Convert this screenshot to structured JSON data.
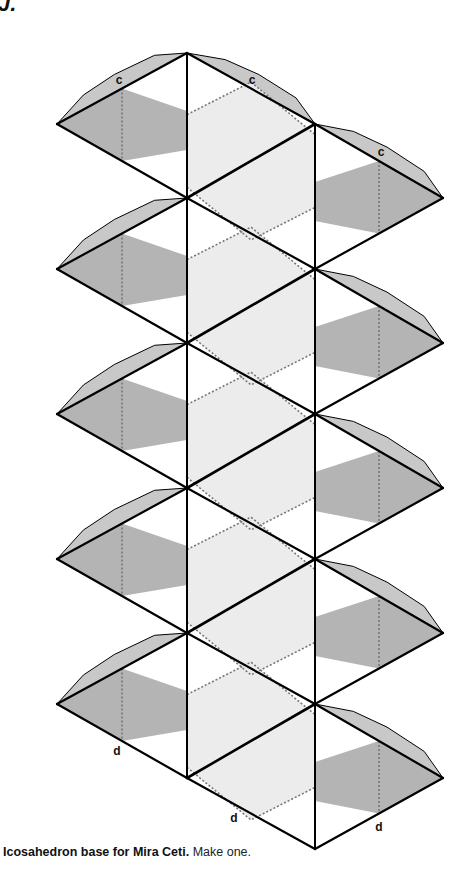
{
  "figure": {
    "corner_fragment": "J.",
    "caption_bold": "Icosahedron base for Mira Ceti.",
    "caption_rest": " Make one.",
    "colors": {
      "line": "#000000",
      "flap_fill": "#c8c8c8",
      "dark_face": "#b4b4b4",
      "light_face": "#ececec",
      "dotted_line": "#777777"
    },
    "geometry": {
      "left_col_x": 187,
      "right_col_x": 315,
      "left_tip_x": 57,
      "right_tip_x": 443,
      "left_col_y0": 53,
      "right_col_y0": 124,
      "step_y": 145,
      "rows": 5
    },
    "edge_labels": [
      {
        "text": "c",
        "x": 119,
        "y": 84
      },
      {
        "text": "c",
        "x": 252,
        "y": 84
      },
      {
        "text": "c",
        "x": 381,
        "y": 156
      },
      {
        "text": "d",
        "x": 117,
        "y": 755
      },
      {
        "text": "d",
        "x": 234,
        "y": 822
      },
      {
        "text": "d",
        "x": 379,
        "y": 831
      }
    ]
  }
}
